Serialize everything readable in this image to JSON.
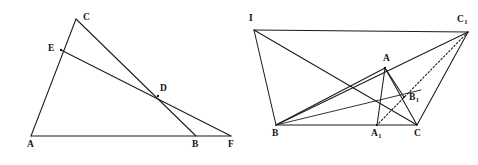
{
  "figure_set": {
    "background_color": "#ffffff",
    "line_color": "#1b1b1b",
    "label_color": "#141414",
    "width": 478,
    "height": 165,
    "caption": ""
  },
  "left_figure": {
    "name": "triangle-with-cevians",
    "points": [
      {
        "id": "A",
        "label": "A",
        "x": 31,
        "y": 136,
        "label_x": 27,
        "label_y": 140
      },
      {
        "id": "C",
        "label": "C",
        "x": 76,
        "y": 19,
        "label_x": 83,
        "label_y": 13
      },
      {
        "id": "E",
        "label": "E",
        "x": 61,
        "y": 50,
        "label_x": 48,
        "label_y": 44
      },
      {
        "id": "D",
        "label": "D",
        "x": 158,
        "y": 96,
        "label_x": 160,
        "label_y": 84
      },
      {
        "id": "B",
        "label": "B",
        "x": 196,
        "y": 136,
        "label_x": 192,
        "label_y": 140
      },
      {
        "id": "F",
        "label": "F",
        "x": 231,
        "y": 136,
        "label_x": 228,
        "label_y": 140
      }
    ],
    "segments": [
      {
        "from": "A",
        "to": "C",
        "style": "solid",
        "note": "side through E"
      },
      {
        "from": "A",
        "to": "F",
        "style": "solid",
        "note": "base line A to F through B"
      },
      {
        "from": "C",
        "to": "B",
        "style": "solid",
        "note": "cevian through D"
      },
      {
        "from": "E",
        "to": "F",
        "style": "solid",
        "note": "cevian through D"
      }
    ]
  },
  "right_figure": {
    "name": "triangle-with-isogonal-construction",
    "points": [
      {
        "id": "I",
        "label": "I",
        "x": 254,
        "y": 30,
        "label_x": 249,
        "label_y": 14
      },
      {
        "id": "C1",
        "label": "C",
        "sub": "1",
        "x": 468,
        "y": 32,
        "label_x": 457,
        "label_y": 15
      },
      {
        "id": "A",
        "label": "A",
        "x": 385,
        "y": 68,
        "label_x": 383,
        "label_y": 54
      },
      {
        "id": "B1",
        "label": "B",
        "sub": "1",
        "x": 404,
        "y": 97,
        "label_x": 409,
        "label_y": 93
      },
      {
        "id": "B",
        "label": "B",
        "x": 276,
        "y": 125,
        "label_x": 272,
        "label_y": 129
      },
      {
        "id": "A1",
        "label": "A",
        "sub": "1",
        "x": 377,
        "y": 125,
        "label_x": 371,
        "label_y": 129
      },
      {
        "id": "C",
        "label": "C",
        "x": 417,
        "y": 125,
        "label_x": 414,
        "label_y": 129
      }
    ],
    "segments": [
      {
        "from": "I",
        "to": "B",
        "style": "solid"
      },
      {
        "from": "I",
        "to": "C",
        "style": "solid"
      },
      {
        "from": "I",
        "to": "C1",
        "style": "solid",
        "note": "passes through A"
      },
      {
        "from": "B",
        "to": "C",
        "style": "solid",
        "note": "base line through A1"
      },
      {
        "from": "B",
        "to": "A",
        "style": "solid"
      },
      {
        "from": "B",
        "to": "C1",
        "style": "solid"
      },
      {
        "from": "B",
        "to": "B1",
        "style": "solid"
      },
      {
        "from": "A",
        "to": "C",
        "style": "solid"
      },
      {
        "from": "A",
        "to": "A1",
        "style": "solid"
      },
      {
        "from": "A",
        "to": "B1",
        "style": "solid"
      },
      {
        "from": "C",
        "to": "C1",
        "style": "solid"
      },
      {
        "from": "C1",
        "to": "A1",
        "style": "dotted",
        "note": "dotted through B1"
      }
    ]
  }
}
